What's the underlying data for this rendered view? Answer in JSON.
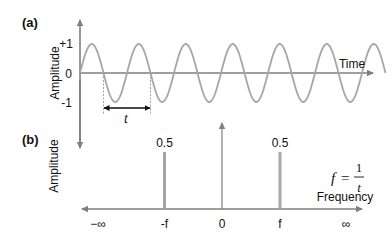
{
  "panel_a": {
    "label": "(a)",
    "y_axis_title": "Amplitude",
    "x_axis_title": "Time",
    "y_ticks": [
      "+1",
      "0",
      "-1"
    ],
    "period_label": "t",
    "signal": "sine wave",
    "cycles_shown": 6.5
  },
  "panel_b": {
    "label": "(b)",
    "y_axis_title": "Amplitude",
    "x_axis_title": "Frequency",
    "x_ticks": [
      "−∞",
      "-f",
      "0",
      "f",
      "∞"
    ],
    "spike_labels": [
      "0.5",
      "0.5"
    ],
    "formula_lhs": "f",
    "formula_eq": "=",
    "formula_num": "1",
    "formula_den": "t"
  },
  "colors": {
    "axis": "#7f7f7f",
    "wave": "#a6a6a6",
    "spike": "#a6a6a6",
    "text": "#111111"
  },
  "chart_data": [
    {
      "type": "line",
      "title": "(a)",
      "xlabel": "Time",
      "ylabel": "Amplitude",
      "ylim": [
        -1,
        1
      ],
      "y_ticks": [
        "+1",
        "0",
        "-1"
      ],
      "series": [
        {
          "name": "sin",
          "description": "sine wave of amplitude 1, period t"
        }
      ],
      "annotations": [
        "t (one period)"
      ]
    },
    {
      "type": "bar",
      "title": "(b)",
      "xlabel": "Frequency",
      "ylabel": "Amplitude",
      "categories": [
        "-f",
        "f"
      ],
      "values": [
        0.5,
        0.5
      ],
      "x_ticks": [
        "−∞",
        "-f",
        "0",
        "f",
        "∞"
      ],
      "annotations": [
        "f = 1/t"
      ]
    }
  ]
}
